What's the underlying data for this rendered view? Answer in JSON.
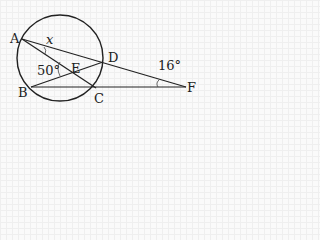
{
  "diagram": {
    "labels": {
      "A": "A",
      "B": "B",
      "C": "C",
      "D": "D",
      "E": "E",
      "F": "F"
    },
    "angles": {
      "x": "x",
      "angle_B_E": "50°",
      "angle_F": "16°"
    },
    "colors": {
      "stroke": "#222222",
      "background": "#fafafa"
    }
  }
}
